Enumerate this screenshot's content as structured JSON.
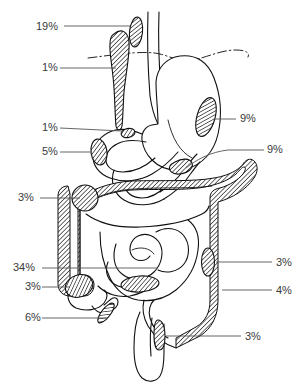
{
  "figure": {
    "background_color": "#ffffff",
    "line_color": "#111111",
    "label_color": "#3a3a3a",
    "lesion_fill": "hatched-diagonal"
  },
  "labels": {
    "left": [
      {
        "id": "esophagus-upper",
        "text": "19%",
        "x": 36,
        "y": 30,
        "leader_to_x": 118,
        "leader_to_y": 26
      },
      {
        "id": "esophagus-mid",
        "text": "1%",
        "x": 42,
        "y": 71,
        "leader_to_x": 113,
        "leader_to_y": 71
      },
      {
        "id": "pylorus",
        "text": "1%",
        "x": 42,
        "y": 131,
        "leader_to_x": 114,
        "leader_to_y": 128
      },
      {
        "id": "duodenum",
        "text": "5%",
        "x": 42,
        "y": 155,
        "leader_to_x": 92,
        "leader_to_y": 152
      },
      {
        "id": "hepatic-flexure",
        "text": "3%",
        "x": 18,
        "y": 201,
        "leader_to_x": 78,
        "leader_to_y": 198
      },
      {
        "id": "small-bowel",
        "text": "34%",
        "x": 13,
        "y": 271,
        "leader_to_x": 160,
        "leader_to_y": 268
      },
      {
        "id": "cecum",
        "text": "3%",
        "x": 25,
        "y": 290,
        "leader_to_x": 70,
        "leader_to_y": 287
      },
      {
        "id": "appendix",
        "text": "6%",
        "x": 25,
        "y": 321,
        "leader_to_x": 106,
        "leader_to_y": 318
      }
    ],
    "right": [
      {
        "id": "gastric-fundus",
        "text": "9%",
        "x": 240,
        "y": 122,
        "leader_to_x": 208,
        "leader_to_y": 119
      },
      {
        "id": "gastric-antrum",
        "text": "9%",
        "x": 266,
        "y": 153,
        "leader_to_x": 178,
        "leader_to_y": 168
      },
      {
        "id": "descending-colon",
        "text": "3%",
        "x": 276,
        "y": 266,
        "leader_to_x": 212,
        "leader_to_y": 262
      },
      {
        "id": "sigmoid-colon",
        "text": "4%",
        "x": 276,
        "y": 294,
        "leader_to_x": 232,
        "leader_to_y": 288
      },
      {
        "id": "rectum",
        "text": "3%",
        "x": 245,
        "y": 340,
        "leader_to_x": 166,
        "leader_to_y": 336
      }
    ]
  },
  "organs": [
    {
      "name": "esophagus",
      "lesion_percent": "19%"
    },
    {
      "name": "esophagus-middle",
      "lesion_percent": "1%"
    },
    {
      "name": "gastroesophageal-junction",
      "lesion_percent": "1%"
    },
    {
      "name": "duodenum",
      "lesion_percent": "5%"
    },
    {
      "name": "gastric-fundus",
      "lesion_percent": "9%"
    },
    {
      "name": "gastric-antrum",
      "lesion_percent": "9%"
    },
    {
      "name": "hepatic-flexure",
      "lesion_percent": "3%"
    },
    {
      "name": "small-intestine",
      "lesion_percent": "34%"
    },
    {
      "name": "cecum",
      "lesion_percent": "3%"
    },
    {
      "name": "appendix",
      "lesion_percent": "6%"
    },
    {
      "name": "descending-colon",
      "lesion_percent": "3%"
    },
    {
      "name": "sigmoid-colon",
      "lesion_percent": "4%"
    },
    {
      "name": "rectum",
      "lesion_percent": "3%"
    }
  ]
}
